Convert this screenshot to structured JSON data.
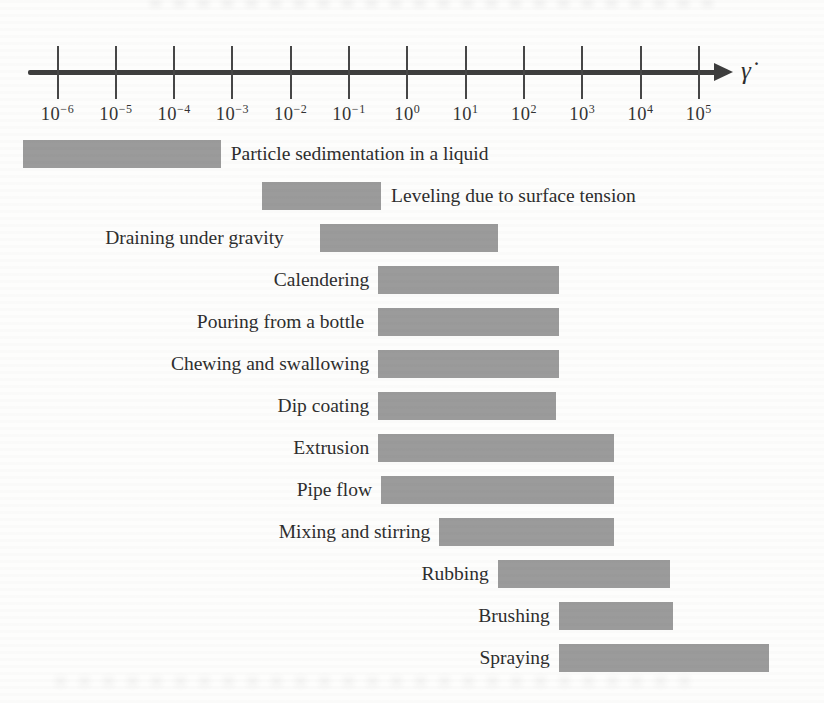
{
  "chart_data": {
    "type": "bar",
    "variant": "horizontal-range-bars",
    "title": "",
    "x_axis": {
      "symbol": "γ̇",
      "label": "shear rate",
      "scale": "log10",
      "tick_exponents": [
        -6,
        -5,
        -4,
        -3,
        -2,
        -1,
        0,
        1,
        2,
        3,
        4,
        5
      ],
      "tick_label_base": "10",
      "grid": false
    },
    "bar_color": "#9b9b9b",
    "axis_color": "#3d3d3d",
    "text_color": "#2e2e2e",
    "items": [
      {
        "label": "Particle sedimentation in a liquid",
        "log_min": -6.6,
        "log_max": -3.2,
        "label_side": "right"
      },
      {
        "label": "Leveling due to surface tension",
        "log_min": -2.5,
        "log_max": -0.45,
        "label_side": "right"
      },
      {
        "label": "Draining under gravity",
        "log_min": -1.5,
        "log_max": 1.55,
        "label_side": "left",
        "label_gap_px": 36
      },
      {
        "label": "Calendering",
        "log_min": -0.5,
        "log_max": 2.6,
        "label_side": "left"
      },
      {
        "label": "Pouring from a bottle",
        "log_min": -0.5,
        "log_max": 2.6,
        "label_side": "left",
        "label_gap_px": 14
      },
      {
        "label": "Chewing and swallowing",
        "log_min": -0.5,
        "log_max": 2.6,
        "label_side": "left"
      },
      {
        "label": "Dip coating",
        "log_min": -0.5,
        "log_max": 2.55,
        "label_side": "left"
      },
      {
        "label": "Extrusion",
        "log_min": -0.5,
        "log_max": 3.55,
        "label_side": "left"
      },
      {
        "label": "Pipe flow",
        "log_min": -0.45,
        "log_max": 3.55,
        "label_side": "left"
      },
      {
        "label": "Mixing and stirring",
        "log_min": 0.55,
        "log_max": 3.55,
        "label_side": "left"
      },
      {
        "label": "Rubbing",
        "log_min": 1.55,
        "log_max": 4.5,
        "label_side": "left"
      },
      {
        "label": "Brushing",
        "log_min": 2.6,
        "log_max": 4.55,
        "label_side": "left"
      },
      {
        "label": "Spraying",
        "log_min": 2.6,
        "log_max": 6.2,
        "label_side": "left"
      }
    ]
  }
}
